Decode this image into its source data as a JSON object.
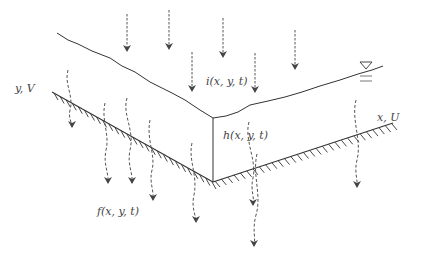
{
  "diagram": {
    "type": "overland flow / infiltration schematic (V-shaped catchment)",
    "labels": {
      "y_axis": "y, V",
      "x_axis": "x, U",
      "rainfall": "i(x, y, t)",
      "depth": "h(x, y, t)",
      "infiltration": "f(x, y, t)"
    },
    "symbols": {
      "water_level": "water-level-triangle"
    },
    "rain_arrows": [
      {
        "x": 127,
        "y1": 14,
        "y2": 52
      },
      {
        "x": 169,
        "y1": 10,
        "y2": 50
      },
      {
        "x": 192,
        "y1": 52,
        "y2": 92
      },
      {
        "x": 223,
        "y1": 18,
        "y2": 58
      },
      {
        "x": 255,
        "y1": 53,
        "y2": 93
      },
      {
        "x": 295,
        "y1": 30,
        "y2": 70
      }
    ],
    "infiltration_arrows": [
      {
        "d": "M68,70 C64,85 74,95 70,110 C68,118 72,122 72,127"
      },
      {
        "d": "M105,103 C101,120 110,135 106,150 C103,165 109,172 108,183"
      },
      {
        "d": "M127,98 C122,115 135,130 130,150 C127,165 133,172 132,183"
      },
      {
        "d": "M150,120 C146,140 156,155 152,170 C149,182 154,190 153,200"
      },
      {
        "d": "M192,143 C188,160 198,175 194,195 C191,208 196,215 196,222"
      },
      {
        "d": "M249,122 C244,140 257,160 253,178 C250,190 255,198 253,205"
      },
      {
        "d": "M257,154 C252,175 262,195 256,215 C252,230 256,238 254,246"
      },
      {
        "d": "M356,100 C351,120 362,140 357,160 C354,172 358,180 357,187"
      }
    ],
    "colors": {
      "line": "#333333",
      "arrow": "#555555",
      "text": "#444444",
      "background": "#ffffff"
    }
  }
}
